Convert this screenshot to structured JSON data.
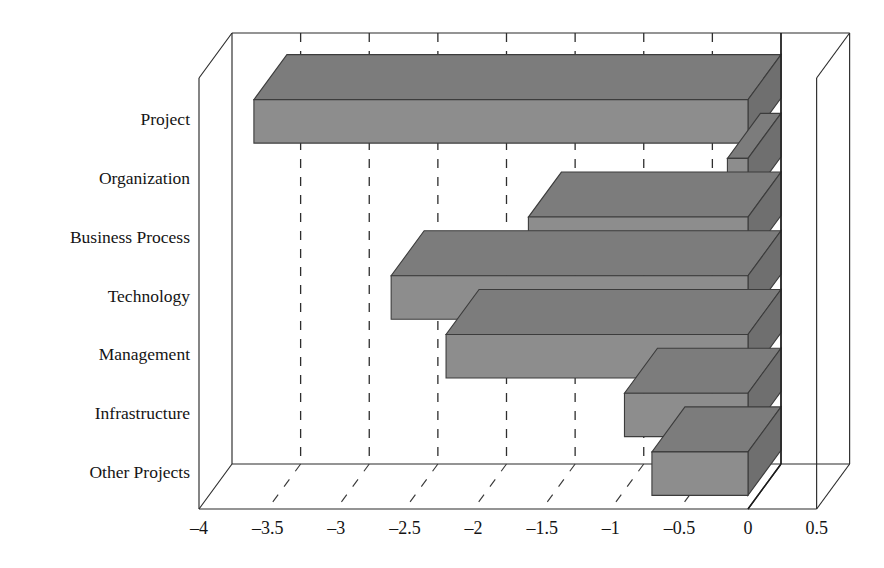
{
  "chart_data": {
    "type": "bar",
    "orientation": "horizontal",
    "style": "3d-bar",
    "title": "",
    "subtitle": "",
    "xlabel": "",
    "ylabel": "",
    "categories": [
      "Project",
      "Organization",
      "Business Process",
      "Technology",
      "Management",
      "Infrastructure",
      "Other Projects"
    ],
    "values": [
      -3.6,
      -0.15,
      -1.6,
      -2.6,
      -2.2,
      -0.9,
      -0.7
    ],
    "series": [
      {
        "name": "",
        "values": [
          -3.6,
          -0.15,
          -1.6,
          -2.6,
          -2.2,
          -0.9,
          -0.7
        ]
      }
    ],
    "xlim": [
      -4,
      0.5
    ],
    "ylim": null,
    "xticks": [
      -4,
      -3.5,
      -3,
      -2.5,
      -2,
      -1.5,
      -1,
      -0.5,
      0,
      0.5
    ],
    "xtick_labels": [
      "-4",
      "-3.5",
      "-3",
      "-2.5",
      "-2",
      "-1.5",
      "-1",
      "-0.5",
      "0",
      "0.5"
    ],
    "grid": true,
    "grid_style": "dashed",
    "legend": null,
    "legend_position": "none",
    "annotations": [],
    "colors": {
      "bar_front": "#8d8d8d",
      "bar_top": "#7c7c7c",
      "bar_side": "#6f6f6f",
      "bar_edge": "#3c3c3c",
      "axis": "#2b2b2b",
      "grid": "#2e2e2e",
      "background": "#ffffff",
      "text": "#141414"
    }
  }
}
